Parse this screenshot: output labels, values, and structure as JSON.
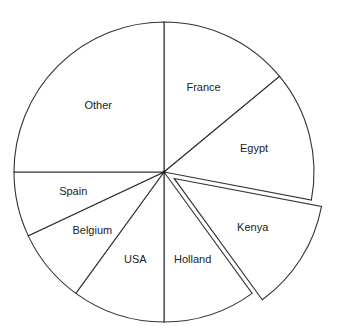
{
  "chart_data": {
    "type": "pie",
    "title": "",
    "start_angle_deg": 0,
    "direction": "clockwise",
    "exploded": [
      "Kenya"
    ],
    "categories": [
      "France",
      "Egypt",
      "Kenya",
      "Holland",
      "USA",
      "Belgium",
      "Spain",
      "Other"
    ],
    "values": [
      14,
      14,
      12,
      10,
      10,
      8,
      7,
      25
    ],
    "unit": "percent (estimated from slice angles)",
    "legend": "none (labels inside slices)"
  },
  "style": {
    "fill": "#ffffff",
    "stroke": "#333333",
    "text": "#222222"
  },
  "labels": {
    "france": "France",
    "egypt": "Egypt",
    "kenya": "Kenya",
    "holland": "Holland",
    "usa": "USA",
    "belgium": "Belgium",
    "spain": "Spain",
    "other": "Other"
  }
}
